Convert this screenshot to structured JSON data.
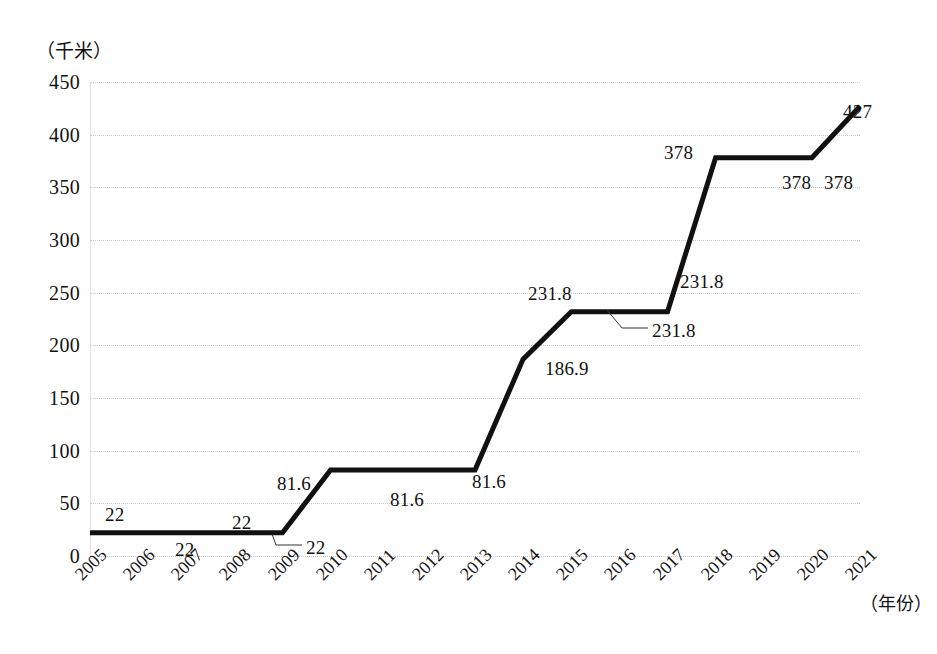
{
  "chart_data": {
    "type": "line",
    "title": "",
    "subtitle": "",
    "xlabel": "（年份）",
    "ylabel": "（千米）",
    "categories": [
      "2005",
      "2006",
      "2007",
      "2008",
      "2009",
      "2010",
      "2011",
      "2012",
      "2013",
      "2014",
      "2015",
      "2016",
      "2017",
      "2018",
      "2019",
      "2020",
      "2021"
    ],
    "values": [
      22,
      22,
      22,
      22,
      22,
      81.6,
      81.6,
      81.6,
      81.6,
      186.9,
      231.8,
      231.8,
      231.8,
      378,
      378,
      378,
      427
    ],
    "series": [
      {
        "name": "",
        "values": [
          22,
          22,
          22,
          22,
          22,
          81.6,
          81.6,
          81.6,
          81.6,
          186.9,
          231.8,
          231.8,
          231.8,
          378,
          378,
          378,
          427
        ]
      }
    ],
    "ylim": [
      0,
      450
    ],
    "ytick_labels": [
      "0",
      "50",
      "100",
      "150",
      "200",
      "250",
      "300",
      "350",
      "400",
      "450"
    ],
    "ytick_values": [
      0,
      50,
      100,
      150,
      200,
      250,
      300,
      350,
      400,
      450
    ],
    "grid": true,
    "grid_style": "dotted",
    "grid_color": "#c9c9c9",
    "legend": false,
    "legend_position": "none",
    "line_color": "#111111",
    "line_width": 5,
    "markers": false,
    "xtick_rotation": -45,
    "annotations": [
      {
        "text": "22",
        "x": 105,
        "y": 504,
        "leader": false
      },
      {
        "text": "22",
        "x": 175,
        "y": 539,
        "leader": false
      },
      {
        "text": "22",
        "x": 232,
        "y": 512,
        "leader": false
      },
      {
        "text": "22",
        "x": 306,
        "y": 537,
        "leader": true
      },
      {
        "text": "81.6",
        "x": 277,
        "y": 473,
        "leader": false
      },
      {
        "text": "81.6",
        "x": 390,
        "y": 489,
        "leader": false
      },
      {
        "text": "81.6",
        "x": 472,
        "y": 471,
        "leader": false
      },
      {
        "text": "186.9",
        "x": 545,
        "y": 358,
        "leader": false
      },
      {
        "text": "231.8",
        "x": 528,
        "y": 283,
        "leader": false
      },
      {
        "text": "231.8",
        "x": 652,
        "y": 320,
        "leader": true
      },
      {
        "text": "231.8",
        "x": 680,
        "y": 271,
        "leader": false
      },
      {
        "text": "378",
        "x": 664,
        "y": 142,
        "leader": false
      },
      {
        "text": "378",
        "x": 782,
        "y": 172,
        "leader": false
      },
      {
        "text": "378",
        "x": 824,
        "y": 172,
        "leader": false
      },
      {
        "text": "427",
        "x": 843,
        "y": 101,
        "leader": false
      }
    ]
  }
}
